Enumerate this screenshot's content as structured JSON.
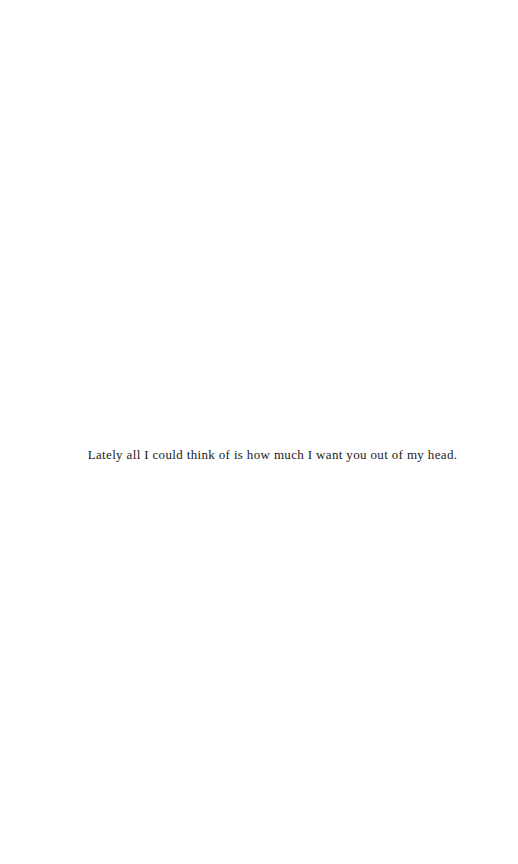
{
  "document": {
    "lines": [
      "Lately all I could think of is how much I want you out of my head."
    ]
  }
}
